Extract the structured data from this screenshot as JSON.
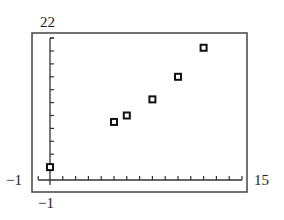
{
  "chart_data": {
    "type": "scatter",
    "title": "",
    "xlabel": "",
    "ylabel": "",
    "xlim": [
      -1,
      15
    ],
    "ylim": [
      -1,
      22
    ],
    "x_tick_step": 1,
    "y_tick_step": 2,
    "grid": false,
    "legend": null,
    "marker": "hollow-square",
    "series": [
      {
        "name": "data",
        "points": [
          {
            "x": 0,
            "y": 2
          },
          {
            "x": 5,
            "y": 9
          },
          {
            "x": 6,
            "y": 10
          },
          {
            "x": 8,
            "y": 12.5
          },
          {
            "x": 10,
            "y": 16
          },
          {
            "x": 12,
            "y": 20.5
          }
        ]
      }
    ],
    "window_labels": {
      "ymax": "22",
      "xmin": "−1",
      "xmax": "15",
      "ymin": "−1"
    }
  },
  "colors": {
    "axis": "#333333",
    "frame": "#444444",
    "marker": "#111111"
  }
}
